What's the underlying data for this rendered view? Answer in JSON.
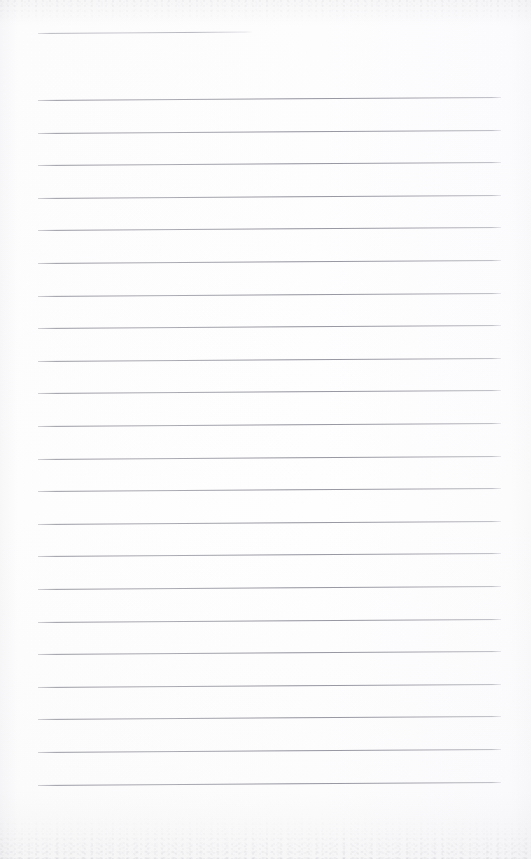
{
  "document": {
    "type": "scanned-ruled-notebook-page",
    "title": "",
    "body_text": "",
    "page_number": "",
    "width_px": 531,
    "height_px": 859,
    "background_color": "#fdfdfd",
    "rule_color": "#9a9aa6",
    "header_rule_color": "#b0b0ba",
    "is_blank": true
  },
  "layout": {
    "left_margin_px": 38,
    "right_edge_px": 501,
    "line_spacing_px": 32.6,
    "first_full_line_y_px": 100,
    "last_full_line_y_px": 793,
    "line_skew_px": -3,
    "header_rule": {
      "x_start_px": 38,
      "x_end_px": 252,
      "y_px": 33,
      "label": "header-rule"
    }
  },
  "rules": [
    {
      "index": 1,
      "y": 100,
      "text": ""
    },
    {
      "index": 2,
      "y": 132.6,
      "text": ""
    },
    {
      "index": 3,
      "y": 165.2,
      "text": ""
    },
    {
      "index": 4,
      "y": 197.8,
      "text": ""
    },
    {
      "index": 5,
      "y": 230.4,
      "text": ""
    },
    {
      "index": 6,
      "y": 263.0,
      "text": ""
    },
    {
      "index": 7,
      "y": 295.6,
      "text": ""
    },
    {
      "index": 8,
      "y": 328.2,
      "text": ""
    },
    {
      "index": 9,
      "y": 360.8,
      "text": ""
    },
    {
      "index": 10,
      "y": 393.4,
      "text": ""
    },
    {
      "index": 11,
      "y": 426.0,
      "text": ""
    },
    {
      "index": 12,
      "y": 458.6,
      "text": ""
    },
    {
      "index": 13,
      "y": 491.2,
      "text": ""
    },
    {
      "index": 14,
      "y": 523.8,
      "text": ""
    },
    {
      "index": 15,
      "y": 556.4,
      "text": ""
    },
    {
      "index": 16,
      "y": 589.0,
      "text": ""
    },
    {
      "index": 17,
      "y": 621.6,
      "text": ""
    },
    {
      "index": 18,
      "y": 654.2,
      "text": ""
    },
    {
      "index": 19,
      "y": 686.8,
      "text": ""
    },
    {
      "index": 20,
      "y": 719.4,
      "text": ""
    },
    {
      "index": 21,
      "y": 752.0,
      "text": ""
    },
    {
      "index": 22,
      "y": 784.6,
      "text": ""
    }
  ]
}
